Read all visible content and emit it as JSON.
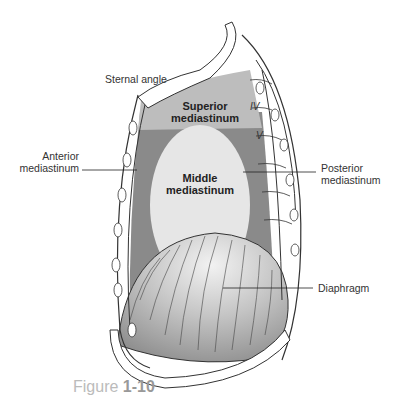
{
  "figure": {
    "caption_prefix": "Figure",
    "caption_number": "1-10",
    "colors": {
      "superior": "#bdbdbd",
      "anterior_posterior": "#8a8a8a",
      "middle": "#e6e6e6",
      "diaphragm": "#b8b8b8",
      "outline": "#333333"
    }
  },
  "labels": {
    "sternal_angle": "Sternal angle",
    "anterior_1": "Anterior",
    "anterior_2": "mediastinum",
    "posterior_1": "Posterior",
    "posterior_2": "mediastinum",
    "superior_1": "Superior",
    "superior_2": "mediastinum",
    "middle_1": "Middle",
    "middle_2": "mediastinum",
    "diaphragm": "Diaphragm",
    "vertebra_iv": "IV",
    "vertebra_v": "V"
  }
}
